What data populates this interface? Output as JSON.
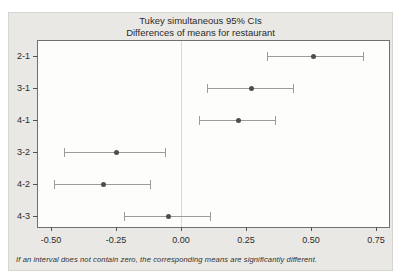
{
  "chart_data": {
    "type": "interval",
    "title": "Tukey simultaneous 95% CIs",
    "subtitle": "Differences of means for restaurant",
    "footnote": "If an interval does not contain zero, the corresponding means are significantly different.",
    "categories": [
      "2-1",
      "3-1",
      "4-1",
      "3-2",
      "4-2",
      "4-3"
    ],
    "intervals": [
      {
        "pair": "2-1",
        "lower": 0.33,
        "center": 0.51,
        "upper": 0.7
      },
      {
        "pair": "3-1",
        "lower": 0.1,
        "center": 0.27,
        "upper": 0.43
      },
      {
        "pair": "4-1",
        "lower": 0.07,
        "center": 0.22,
        "upper": 0.36
      },
      {
        "pair": "3-2",
        "lower": -0.45,
        "center": -0.25,
        "upper": -0.06
      },
      {
        "pair": "4-2",
        "lower": -0.49,
        "center": -0.3,
        "upper": -0.12
      },
      {
        "pair": "4-3",
        "lower": -0.22,
        "center": -0.05,
        "upper": 0.11
      }
    ],
    "xlim": [
      -0.55,
      0.8
    ],
    "xticks": [
      {
        "value": -0.5,
        "label": "-0.50"
      },
      {
        "value": -0.25,
        "label": "-0.25"
      },
      {
        "value": 0.0,
        "label": "0.00"
      },
      {
        "value": 0.25,
        "label": "0.25"
      },
      {
        "value": 0.5,
        "label": "0.50"
      },
      {
        "value": 0.75,
        "label": "0.75"
      }
    ],
    "reference_line_x": 0,
    "grid": "reference-line-only",
    "legend": "none"
  },
  "colors": {
    "figure_background": "#e9e8e4",
    "plot_background": "#fdfdfb",
    "plot_border": "#707070",
    "axis_tick": "#555553",
    "interval_line": "#9b9b99",
    "mean_dot": "#4d4d4b",
    "zero_line": "#d9d8d3",
    "text": "#2b2b2b"
  }
}
